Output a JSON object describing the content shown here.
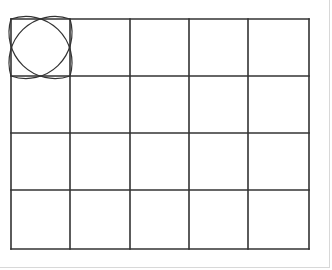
{
  "diagram": {
    "type": "grid",
    "rows": 4,
    "columns": 5,
    "x_lines": [
      11,
      70,
      130,
      189,
      248,
      309
    ],
    "y_lines": [
      19,
      76,
      133,
      190,
      249
    ],
    "line_color": "#333333",
    "line_width": 1.6,
    "highlighted_cell": {
      "row": 0,
      "column": 0,
      "pattern": "four-petal-flower",
      "pattern_color": "#333333"
    }
  }
}
